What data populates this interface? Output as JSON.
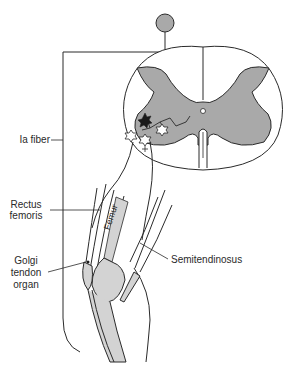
{
  "diagram": {
    "type": "anatomical reflex diagram",
    "colors": {
      "gray_matter": "#a9a9a9",
      "bone": "#d3d3d3",
      "line": "#2a2a2a",
      "background": "#ffffff"
    },
    "labels": {
      "ia_fiber": "Ia fiber",
      "rectus_femoris_1": "Rectus",
      "rectus_femoris_2": "femoris",
      "golgi_1": "Golgi",
      "golgi_2": "tendon",
      "golgi_3": "organ",
      "semitendinosus": "Semitendinosus",
      "femur": "Femur"
    },
    "elements": [
      "dorsal root ganglion",
      "spinal cord cross-section",
      "inhibitory interneuron (black star)",
      "motor neurons (white stars)",
      "Ia afferent fiber",
      "leg with femur, knee and tibia"
    ]
  }
}
